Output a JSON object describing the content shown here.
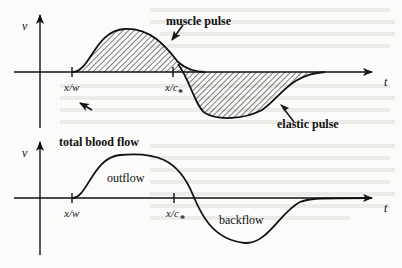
{
  "top_panel": {
    "y_axis_label": "v",
    "x_axis_label": "t",
    "tick_1": "x/w",
    "tick_2": "x/c",
    "tick_2_mark": "*",
    "annotation_muscle": "muscle pulse",
    "annotation_elastic": "elastic pulse"
  },
  "bottom_panel": {
    "title": "total  blood flow",
    "y_axis_label": "v",
    "x_axis_label": "t",
    "tick_1": "x/w",
    "tick_2": "x/c",
    "tick_2_mark": "*",
    "region_positive": "outflow",
    "region_negative": "backflow"
  },
  "colors": {
    "ink": "#111111",
    "paper": "#fbfbfa",
    "ghost_text": "#e6e6e3"
  }
}
